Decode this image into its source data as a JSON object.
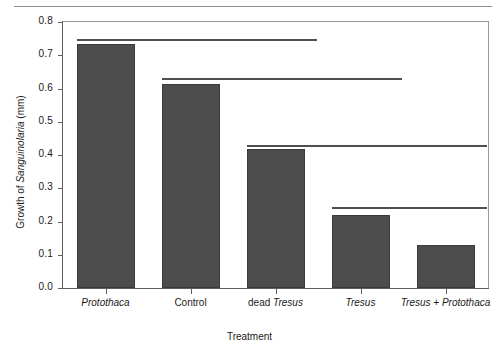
{
  "page": {
    "top_rule": "scan-page-rule"
  },
  "chart_data": {
    "type": "bar",
    "title": "",
    "xlabel": "Treatment",
    "ylabel": "Growth of Sanguinolaria (mm)",
    "ylabel_parts": [
      {
        "text": "Growth of ",
        "italic": false
      },
      {
        "text": "Sanguinolaria",
        "italic": true
      },
      {
        "text": " (mm)",
        "italic": false
      }
    ],
    "categories": [
      "Protothaca",
      "Control",
      "dead Tresus",
      "Tresus",
      "Tresus + Protothaca"
    ],
    "category_parts": [
      [
        {
          "text": "Protothaca",
          "italic": true
        }
      ],
      [
        {
          "text": "Control",
          "italic": false
        }
      ],
      [
        {
          "text": "dead ",
          "italic": false
        },
        {
          "text": "Tresus",
          "italic": true
        }
      ],
      [
        {
          "text": "Tresus",
          "italic": true
        }
      ],
      [
        {
          "text": "Tresus + Protothaca",
          "italic": true
        }
      ]
    ],
    "values": [
      0.735,
      0.613,
      0.417,
      0.22,
      0.129
    ],
    "ylim": [
      0.0,
      0.8
    ],
    "ytick_values": [
      0.8,
      0.7,
      0.6,
      0.5,
      0.4,
      0.3,
      0.2,
      0.1,
      0.0
    ],
    "ytick_labels": [
      "0.8",
      "0.7",
      "0.6",
      "0.5",
      "0.4",
      "0.3",
      "0.2",
      "0.1",
      "0.0"
    ],
    "grid": false,
    "legend": null,
    "bar_color": "#4d4d4d",
    "axis_color": "#5f5f5f",
    "annotations": [
      {
        "name": "significance-line-1",
        "y": 0.75,
        "from_category": 0,
        "to_category": 2,
        "label": ""
      },
      {
        "name": "significance-line-2",
        "y": 0.633,
        "from_category": 1,
        "to_category": 3,
        "label": ""
      },
      {
        "name": "significance-line-3",
        "y": 0.43,
        "from_category": 2,
        "to_category": 4,
        "label": ""
      },
      {
        "name": "significance-line-4",
        "y": 0.245,
        "from_category": 3,
        "to_category": 4,
        "label": ""
      }
    ]
  }
}
